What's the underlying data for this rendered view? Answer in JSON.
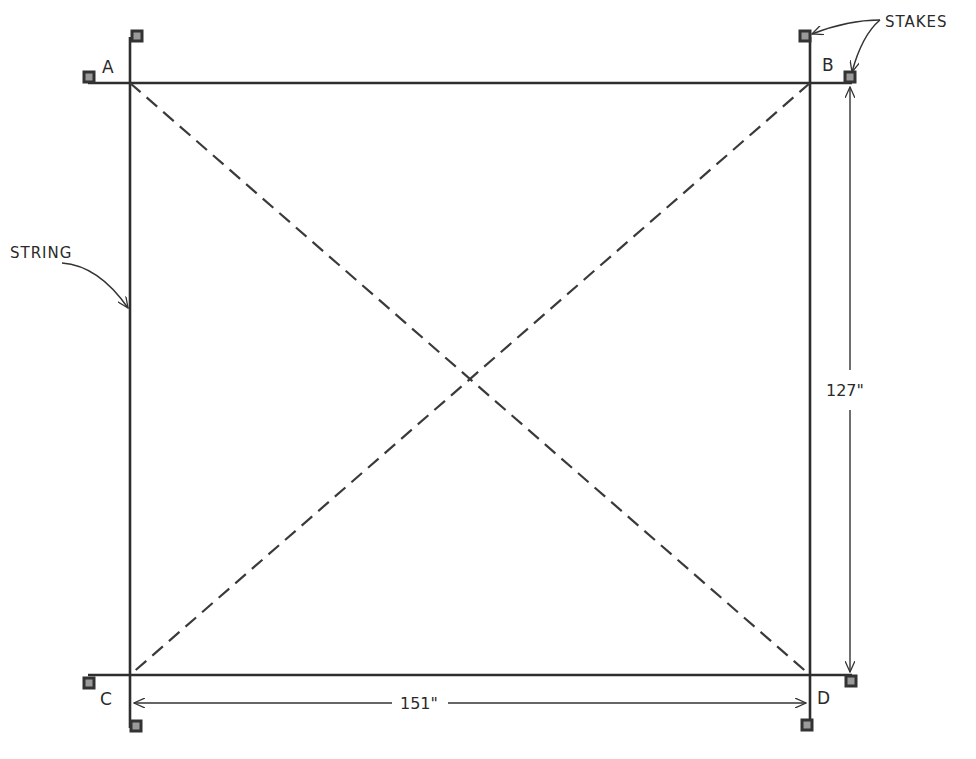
{
  "diagram": {
    "type": "layout-stakeout",
    "corners": [
      {
        "id": "A",
        "label": "A",
        "x": 130,
        "y": 83
      },
      {
        "id": "B",
        "label": "B",
        "x": 810,
        "y": 83
      },
      {
        "id": "C",
        "label": "C",
        "x": 130,
        "y": 675
      },
      {
        "id": "D",
        "label": "D",
        "x": 810,
        "y": 675
      }
    ],
    "annotations": {
      "stakes": "STAKES",
      "string": "STRING"
    },
    "dimensions": {
      "width": "151\"",
      "height": "127\""
    },
    "colors": {
      "line": "#2e2e2e",
      "stake_fill": "#9a9a9a",
      "stake_border": "#333333"
    }
  }
}
